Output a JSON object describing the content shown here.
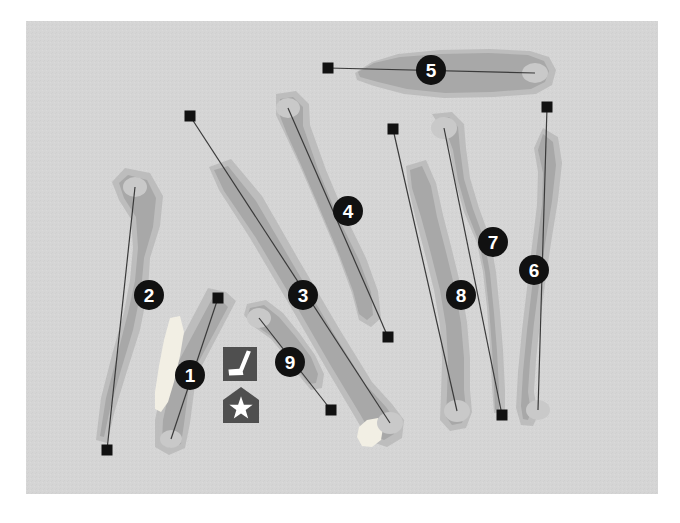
{
  "map": {
    "title": "Golf Course Layout Map",
    "plate_bounds": {
      "x": 26,
      "y": 21,
      "width": 632,
      "height": 473
    },
    "colors": {
      "page_background": "#ffffff",
      "map_background": "#d5d5d5",
      "rough": "#bdbdbd",
      "fairway": "#a8a8a8",
      "green": "#c9c9c9",
      "bunker": "#f2efe4",
      "marker_fill": "#111111",
      "marker_text": "#ffffff",
      "centerline": "#3a3a3a",
      "tee_box": "#111111",
      "icon_fill": "#4f4f4f",
      "icon_glyph": "#ffffff"
    }
  },
  "legend_icons": [
    {
      "id": "putter",
      "name": "golf-club-icon",
      "label": "Practice green / putting area",
      "x": 223,
      "y": 347,
      "size": 34
    },
    {
      "id": "clubhouse",
      "name": "clubhouse-star-icon",
      "label": "Clubhouse",
      "x": 223,
      "y": 387,
      "size": 36
    }
  ],
  "holes": [
    {
      "number": "1",
      "marker": {
        "x": 190,
        "y": 375,
        "r": 15
      },
      "tee": {
        "x": 218,
        "y": 298,
        "size": 11
      },
      "green": {
        "cx": 171,
        "cy": 439,
        "rx": 11,
        "ry": 9
      },
      "centerline": [
        [
          218,
          298
        ],
        [
          171,
          439
        ]
      ],
      "rough": "M 226 292 L 236 301 L 196 377 L 190 423 L 185 448 L 169 455 L 155 447 L 155 420 L 166 368 L 208 288 Z",
      "fairway": "M 221 300 L 228 307 L 190 378 L 184 424 L 181 444 L 170 448 L 162 441 L 163 420 L 174 370 L 213 297 Z"
    },
    {
      "number": "2",
      "marker": {
        "x": 149,
        "y": 295,
        "r": 15
      },
      "tee": {
        "x": 107,
        "y": 450,
        "size": 11
      },
      "green": {
        "cx": 135,
        "cy": 187,
        "rx": 12,
        "ry": 10
      },
      "centerline": [
        [
          107,
          450
        ],
        [
          135,
          187
        ]
      ],
      "rough": "M 125 168 L 150 173 L 163 196 L 160 226 L 150 258 L 148 290 L 140 330 L 127 371 L 115 410 L 107 443 L 96 440 L 101 398 L 112 355 L 124 312 L 130 280 L 133 248 L 131 219 L 119 200 L 112 182 Z",
      "fairway": "M 128 175 L 147 180 L 156 198 L 153 227 L 144 258 L 141 291 L 133 330 L 121 370 L 110 409 L 104 437 L 100 436 L 106 398 L 117 356 L 128 313 L 135 281 L 138 248 L 136 217 L 124 198 L 119 183 Z"
    },
    {
      "number": "3",
      "marker": {
        "x": 303,
        "y": 295,
        "r": 15
      },
      "tee": {
        "x": 190,
        "y": 116,
        "size": 11
      },
      "green": {
        "cx": 390,
        "cy": 423,
        "rx": 13,
        "ry": 11
      },
      "centerline": [
        [
          190,
          116
        ],
        [
          390,
          423
        ]
      ],
      "rough": "M 209 167 L 231 159 L 262 196 L 300 262 L 340 330 L 372 382 L 392 404 L 404 420 L 402 438 L 387 447 L 369 441 L 355 417 L 326 368 L 289 304 L 250 238 L 219 190 Z",
      "fairway": "M 214 170 L 228 166 L 256 201 L 294 266 L 334 334 L 366 385 L 386 407 L 396 421 L 394 434 L 384 440 L 372 435 L 360 414 L 331 366 L 294 302 L 256 238 L 224 191 Z"
    },
    {
      "number": "4",
      "marker": {
        "x": 348,
        "y": 211
      },
      "tee": {
        "x": 388,
        "y": 337,
        "size": 11
      },
      "green": {
        "cx": 288,
        "cy": 108,
        "rx": 12,
        "ry": 10
      },
      "centerline": [
        [
          388,
          337
        ],
        [
          288,
          108
        ]
      ],
      "rough": "M 276 94 L 296 91 L 309 104 L 310 125 L 326 170 L 344 213 L 366 258 L 378 291 L 381 318 L 371 327 L 359 320 L 352 293 L 338 255 L 318 208 L 300 166 L 285 134 L 276 115 Z",
      "fairway": "M 280 99 L 293 97 L 303 107 L 303 126 L 319 172 L 337 215 L 359 260 L 371 292 L 373 315 L 367 320 L 359 314 L 353 291 L 339 254 L 319 207 L 301 165 L 287 134 L 280 116 Z"
    },
    {
      "number": "5",
      "marker": {
        "x": 431,
        "y": 70,
        "r": 15
      },
      "tee": {
        "x": 328,
        "y": 68,
        "size": 11
      },
      "green": {
        "cx": 535,
        "cy": 73,
        "rx": 13,
        "ry": 10
      },
      "centerline": [
        [
          328,
          68
        ],
        [
          535,
          73
        ]
      ],
      "rough": "M 355 73 L 372 62 L 398 54 L 440 50 L 490 49 L 530 51 L 549 57 L 556 70 L 552 85 L 536 94 L 494 97 L 444 98 L 404 94 L 374 86 L 357 80 Z",
      "fairway": "M 358 72 L 374 63 L 400 57 L 441 54 L 489 53 L 528 55 L 544 61 L 549 71 L 545 82 L 531 89 L 492 92 L 445 93 L 407 89 L 378 82 L 360 77 Z"
    },
    {
      "number": "6",
      "marker": {
        "x": 534,
        "y": 270,
        "r": 15
      },
      "tee": {
        "x": 547,
        "y": 107,
        "size": 11
      },
      "green": {
        "cx": 538,
        "cy": 410,
        "rx": 12,
        "ry": 10
      },
      "centerline": [
        [
          547,
          107
        ],
        [
          538,
          410
        ]
      ],
      "rough": "M 543 128 L 558 137 L 562 163 L 558 200 L 551 243 L 545 284 L 540 322 L 536 360 L 534 392 L 538 415 L 533 426 L 521 425 L 516 408 L 518 372 L 522 330 L 527 288 L 532 246 L 537 205 L 538 172 L 534 148 Z",
      "fairway": "M 543 134 L 553 142 L 556 165 L 552 201 L 545 244 L 539 285 L 534 323 L 530 361 L 528 392 L 531 412 L 528 420 L 523 419 L 521 406 L 523 372 L 527 330 L 532 288 L 537 246 L 542 205 L 543 173 L 538 150 Z"
    },
    {
      "number": "7",
      "marker": {
        "x": 493,
        "y": 242,
        "r": 15
      },
      "tee": {
        "x": 502,
        "y": 415,
        "size": 11
      },
      "green": {
        "cx": 444,
        "cy": 128,
        "rx": 13,
        "ry": 11
      },
      "centerline": [
        [
          444,
          128
        ],
        [
          502,
          415
        ]
      ],
      "rough": "M 432 114 L 452 112 L 464 124 L 466 148 L 470 178 L 479 208 L 490 238 L 496 272 L 500 312 L 503 350 L 505 390 L 505 412 L 494 413 L 492 386 L 490 348 L 487 308 L 483 272 L 477 243 L 464 212 L 455 180 L 450 150 L 443 132 Z",
      "fairway": "M 436 119 L 449 117 L 458 127 L 460 149 L 464 179 L 473 209 L 484 239 L 490 273 L 494 313 L 497 351 L 499 390 L 499 409 L 495 410 L 494 386 L 492 348 L 489 308 L 485 272 L 479 242 L 467 212 L 458 180 L 453 150 L 446 131 Z"
    },
    {
      "number": "8",
      "marker": {
        "x": 461,
        "y": 295,
        "r": 15
      },
      "tee": {
        "x": 393,
        "y": 129,
        "size": 11
      },
      "green": {
        "cx": 457,
        "cy": 411,
        "rx": 13,
        "ry": 11
      },
      "centerline": [
        [
          393,
          129
        ],
        [
          457,
          411
        ]
      ],
      "rough": "M 406 166 L 426 160 L 436 183 L 443 215 L 452 250 L 461 287 L 467 322 L 470 358 L 470 390 L 472 412 L 466 428 L 450 431 L 440 420 L 441 394 L 442 360 L 440 326 L 434 290 L 425 254 L 415 216 L 408 186 Z",
      "fairway": "M 410 170 L 422 166 L 431 186 L 437 217 L 446 252 L 455 289 L 461 323 L 464 358 L 464 390 L 466 410 L 462 423 L 452 425 L 446 417 L 447 394 L 448 360 L 446 326 L 440 290 L 431 254 L 421 217 L 412 188 Z"
    },
    {
      "number": "9",
      "marker": {
        "x": 290,
        "y": 362,
        "r": 15
      },
      "tee": {
        "x": 331,
        "y": 410,
        "size": 11
      },
      "green": {
        "cx": 259,
        "cy": 318,
        "rx": 12,
        "ry": 10
      },
      "centerline": [
        [
          259,
          318
        ],
        [
          331,
          410
        ]
      ],
      "rough": "M 247 304 L 266 300 L 283 313 L 300 334 L 315 355 L 324 374 L 322 388 L 311 390 L 301 378 L 287 358 L 271 339 L 253 326 L 244 315 Z",
      "fairway": "M 250 308 L 264 305 L 279 317 L 296 337 L 311 357 L 318 374 L 316 383 L 309 384 L 300 373 L 287 354 L 271 336 L 255 325 L 248 314 Z"
    }
  ],
  "bunkers": [
    {
      "name": "bunker-hole-1-left",
      "path": "M 170 318 L 180 316 L 184 332 L 180 356 L 174 382 L 168 402 L 161 412 L 155 409 L 155 392 L 159 366 L 164 340 Z"
    },
    {
      "name": "bunker-hole-3-green",
      "path": "M 367 420 L 378 418 L 383 428 L 381 440 L 372 447 L 362 446 L 357 437 L 359 427 Z"
    }
  ]
}
